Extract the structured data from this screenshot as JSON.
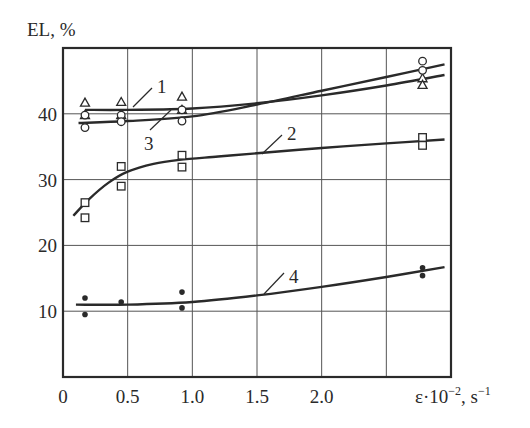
{
  "chart_data": {
    "type": "line",
    "title": "",
    "ylabel": "EL, %",
    "xlabel": "ε·10⁻², s⁻¹",
    "xlabel_parts": {
      "main": "ε·10",
      "exp1": "−2",
      "mid": ", s",
      "exp2": "−1"
    },
    "xlim": [
      0,
      3.0
    ],
    "ylim": [
      0,
      50
    ],
    "grid": true,
    "legend": "none (curves labeled inline 1–4)",
    "x_ticks": [
      0,
      0.5,
      1.0,
      1.5,
      2.0,
      2.5
    ],
    "x_tick_labels": [
      "0",
      "0.5",
      "1.0",
      "1.5",
      "2.0",
      ""
    ],
    "y_ticks": [
      10,
      20,
      30,
      40
    ],
    "y_tick_labels": [
      "10",
      "20",
      "30",
      "40"
    ],
    "series": [
      {
        "name": "1",
        "marker": "triangle",
        "curve": {
          "x": [
            0.17,
            0.5,
            1.0,
            1.5,
            2.0,
            2.5,
            2.95
          ],
          "y": [
            40.6,
            40.6,
            40.8,
            41.6,
            42.8,
            44.3,
            45.9
          ]
        },
        "points": [
          {
            "x": 0.17,
            "y": 41.7
          },
          {
            "x": 0.17,
            "y": 39.8
          },
          {
            "x": 0.45,
            "y": 41.8
          },
          {
            "x": 0.45,
            "y": 39.8
          },
          {
            "x": 0.92,
            "y": 42.6
          },
          {
            "x": 0.92,
            "y": 40.6
          },
          {
            "x": 2.78,
            "y": 45.4
          },
          {
            "x": 2.78,
            "y": 44.4
          }
        ],
        "label_pos": {
          "x": 157,
          "y": 93
        },
        "leader": [
          [
            133,
            107
          ],
          [
            152,
            88
          ]
        ]
      },
      {
        "name": "2",
        "marker": "square",
        "curve": {
          "x": [
            0.08,
            0.2,
            0.35,
            0.5,
            0.7,
            0.9,
            1.2,
            1.5,
            2.0,
            2.5,
            2.95
          ],
          "y": [
            24.5,
            27.0,
            29.5,
            31.2,
            32.4,
            33.0,
            33.5,
            34.0,
            34.8,
            35.5,
            36.1
          ]
        },
        "points": [
          {
            "x": 0.17,
            "y": 26.5
          },
          {
            "x": 0.17,
            "y": 24.2
          },
          {
            "x": 0.45,
            "y": 32.0
          },
          {
            "x": 0.45,
            "y": 29.0
          },
          {
            "x": 0.92,
            "y": 33.7
          },
          {
            "x": 0.92,
            "y": 31.9
          },
          {
            "x": 2.78,
            "y": 36.4
          },
          {
            "x": 2.78,
            "y": 35.2
          }
        ],
        "label_pos": {
          "x": 287,
          "y": 140
        },
        "leader": [
          [
            262,
            154
          ],
          [
            282,
            135
          ]
        ]
      },
      {
        "name": "3",
        "marker": "circle",
        "curve": {
          "x": [
            0.12,
            0.5,
            1.0,
            1.5,
            2.0,
            2.5,
            2.95
          ],
          "y": [
            38.6,
            38.9,
            39.6,
            41.4,
            43.5,
            45.6,
            47.5
          ]
        },
        "points": [
          {
            "x": 0.17,
            "y": 39.8
          },
          {
            "x": 0.17,
            "y": 37.9
          },
          {
            "x": 0.45,
            "y": 39.8
          },
          {
            "x": 0.45,
            "y": 38.8
          },
          {
            "x": 0.92,
            "y": 40.6
          },
          {
            "x": 0.92,
            "y": 38.9
          },
          {
            "x": 2.78,
            "y": 48.0
          },
          {
            "x": 2.78,
            "y": 46.6
          }
        ],
        "label_pos": {
          "x": 144,
          "y": 150
        },
        "leader": [
          [
            150,
            130
          ],
          [
            171,
            110
          ]
        ]
      },
      {
        "name": "4",
        "marker": "dot",
        "curve": {
          "x": [
            0.1,
            0.5,
            1.0,
            1.5,
            2.0,
            2.5,
            2.95
          ],
          "y": [
            11.0,
            11.0,
            11.4,
            12.4,
            13.7,
            15.2,
            16.7
          ]
        },
        "points": [
          {
            "x": 0.17,
            "y": 12.0
          },
          {
            "x": 0.17,
            "y": 9.5
          },
          {
            "x": 0.45,
            "y": 11.4
          },
          {
            "x": 0.92,
            "y": 12.9
          },
          {
            "x": 0.92,
            "y": 10.5
          },
          {
            "x": 2.78,
            "y": 16.6
          },
          {
            "x": 2.78,
            "y": 15.4
          }
        ],
        "label_pos": {
          "x": 289,
          "y": 283
        },
        "leader": [
          [
            264,
            294
          ],
          [
            284,
            273
          ]
        ]
      }
    ]
  },
  "colors": {
    "ink": "#2a2a2a",
    "grid": "#555555",
    "background": "#ffffff"
  }
}
